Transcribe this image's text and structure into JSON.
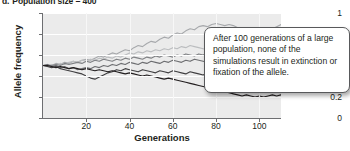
{
  "figure": {
    "panel_label": "d.",
    "title": "Population size = 400"
  },
  "callout": {
    "text": "After 100 generations of a large population, none of the simulations result in extinction or fixation of the allele."
  },
  "chart_data": {
    "type": "line",
    "title": "Population size = 400",
    "xlabel": "Generations",
    "ylabel": "Allele frequency",
    "xlim": [
      0,
      110
    ],
    "ylim": [
      0,
      1
    ],
    "xticks": [
      20,
      40,
      60,
      80,
      100
    ],
    "yticks": [
      "0",
      "0.2",
      "0.4",
      "0.6",
      "0.8",
      "1"
    ],
    "ytick_values": [
      0,
      0.2,
      0.4,
      0.6,
      0.8,
      1
    ],
    "grid": "horizontal-white-on-gray",
    "legend": "none",
    "x_step": 2,
    "series": [
      {
        "name": "simulation-1",
        "color": "#a7a9ac",
        "values": [
          0.5,
          0.51,
          0.5,
          0.52,
          0.51,
          0.53,
          0.52,
          0.54,
          0.53,
          0.55,
          0.56,
          0.55,
          0.57,
          0.59,
          0.58,
          0.6,
          0.62,
          0.61,
          0.63,
          0.65,
          0.64,
          0.67,
          0.69,
          0.68,
          0.71,
          0.73,
          0.72,
          0.75,
          0.77,
          0.76,
          0.79,
          0.81,
          0.8,
          0.83,
          0.85,
          0.84,
          0.87,
          0.88,
          0.87,
          0.89,
          0.9,
          0.89,
          0.88,
          0.89,
          0.88,
          0.86,
          0.85,
          0.84,
          0.83,
          0.82,
          0.82,
          0.83,
          0.84,
          0.85,
          0.87,
          0.89
        ]
      },
      {
        "name": "simulation-2",
        "color": "#bcbec0",
        "values": [
          0.5,
          0.5,
          0.51,
          0.5,
          0.52,
          0.51,
          0.53,
          0.54,
          0.53,
          0.55,
          0.54,
          0.56,
          0.55,
          0.57,
          0.56,
          0.58,
          0.57,
          0.59,
          0.58,
          0.6,
          0.62,
          0.61,
          0.63,
          0.62,
          0.64,
          0.63,
          0.65,
          0.64,
          0.66,
          0.65,
          0.67,
          0.66,
          0.68,
          0.67,
          0.69,
          0.68,
          0.67,
          0.66,
          0.65,
          0.66,
          0.67,
          0.68,
          0.69,
          0.7,
          0.71,
          0.7,
          0.69,
          0.7,
          0.71,
          0.72,
          0.73,
          0.72,
          0.73,
          0.74,
          0.75,
          0.74
        ]
      },
      {
        "name": "simulation-3",
        "color": "#808285",
        "values": [
          0.5,
          0.49,
          0.5,
          0.51,
          0.5,
          0.52,
          0.51,
          0.52,
          0.53,
          0.52,
          0.54,
          0.53,
          0.55,
          0.54,
          0.56,
          0.55,
          0.54,
          0.56,
          0.55,
          0.57,
          0.56,
          0.58,
          0.57,
          0.56,
          0.58,
          0.57,
          0.59,
          0.58,
          0.6,
          0.59,
          0.58,
          0.6,
          0.59,
          0.61,
          0.6,
          0.59,
          0.61,
          0.6,
          0.62,
          0.61,
          0.6,
          0.59,
          0.61,
          0.6,
          0.59,
          0.58,
          0.6,
          0.59,
          0.58,
          0.57,
          0.59,
          0.58,
          0.57,
          0.56,
          0.58,
          0.57
        ]
      },
      {
        "name": "simulation-4",
        "color": "#6d6e71",
        "values": [
          0.5,
          0.51,
          0.49,
          0.5,
          0.48,
          0.49,
          0.47,
          0.48,
          0.46,
          0.47,
          0.48,
          0.47,
          0.49,
          0.48,
          0.5,
          0.49,
          0.51,
          0.5,
          0.52,
          0.51,
          0.53,
          0.52,
          0.51,
          0.53,
          0.52,
          0.54,
          0.53,
          0.52,
          0.54,
          0.53,
          0.55,
          0.54,
          0.53,
          0.55,
          0.54,
          0.56,
          0.55,
          0.54,
          0.53,
          0.55,
          0.54,
          0.53,
          0.52,
          0.54,
          0.53,
          0.52,
          0.51,
          0.53,
          0.52,
          0.51,
          0.5,
          0.52,
          0.51,
          0.5,
          0.52,
          0.51
        ]
      },
      {
        "name": "simulation-5",
        "color": "#414042",
        "values": [
          0.5,
          0.49,
          0.48,
          0.49,
          0.47,
          0.46,
          0.45,
          0.44,
          0.43,
          0.42,
          0.4,
          0.38,
          0.37,
          0.39,
          0.41,
          0.43,
          0.44,
          0.46,
          0.45,
          0.47,
          0.46,
          0.45,
          0.44,
          0.46,
          0.45,
          0.44,
          0.43,
          0.45,
          0.44,
          0.43,
          0.45,
          0.44,
          0.43,
          0.42,
          0.44,
          0.43,
          0.42,
          0.41,
          0.43,
          0.42,
          0.41,
          0.4,
          0.42,
          0.41,
          0.4,
          0.42,
          0.41,
          0.43,
          0.42,
          0.44,
          0.43,
          0.45,
          0.44,
          0.46,
          0.45,
          0.47
        ]
      },
      {
        "name": "simulation-6",
        "color": "#231f20",
        "values": [
          0.5,
          0.5,
          0.49,
          0.48,
          0.49,
          0.48,
          0.47,
          0.48,
          0.47,
          0.46,
          0.47,
          0.46,
          0.45,
          0.46,
          0.45,
          0.44,
          0.45,
          0.44,
          0.43,
          0.42,
          0.43,
          0.42,
          0.41,
          0.4,
          0.41,
          0.4,
          0.39,
          0.38,
          0.37,
          0.38,
          0.37,
          0.36,
          0.35,
          0.34,
          0.33,
          0.32,
          0.31,
          0.3,
          0.29,
          0.28,
          0.27,
          0.26,
          0.25,
          0.24,
          0.23,
          0.22,
          0.21,
          0.22,
          0.21,
          0.2,
          0.21,
          0.2,
          0.21,
          0.22,
          0.21,
          0.22
        ]
      }
    ]
  }
}
